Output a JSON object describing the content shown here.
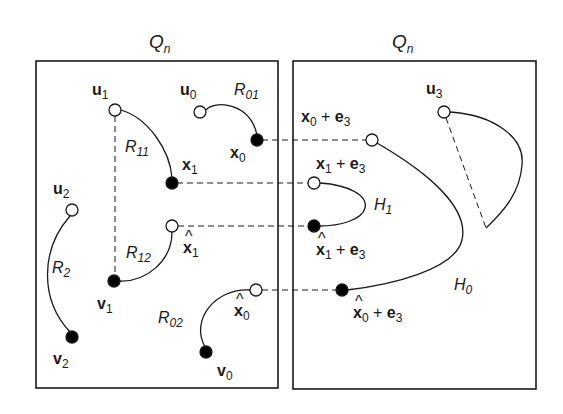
{
  "figure": {
    "left_panel": {
      "title": "Q",
      "title_sub": "n"
    },
    "right_panel": {
      "title": "Q",
      "title_sub": "n"
    },
    "colors": {
      "stroke": "#1a1a1a",
      "open_node_fill": "#ffffff",
      "closed_node_fill": "#000000"
    }
  },
  "labels": {
    "u1": {
      "base": "u",
      "sub": "1"
    },
    "u0": {
      "base": "u",
      "sub": "0"
    },
    "R01": {
      "base": "R",
      "sub": "01"
    },
    "R11": {
      "base": "R",
      "sub": "11"
    },
    "x1": {
      "base": "x",
      "sub": "1"
    },
    "x0": {
      "base": "x",
      "sub": "0"
    },
    "u2": {
      "base": "u",
      "sub": "2"
    },
    "R12": {
      "base": "R",
      "sub": "12"
    },
    "xhat1": {
      "hat": "^",
      "base": "x",
      "sub": "1"
    },
    "R2": {
      "base": "R",
      "sub": "2"
    },
    "v1": {
      "base": "v",
      "sub": "1"
    },
    "xhat0": {
      "hat": "^",
      "base": "x",
      "sub": "0"
    },
    "R02": {
      "base": "R",
      "sub": "02"
    },
    "v2": {
      "base": "v",
      "sub": "2"
    },
    "v0": {
      "base": "v",
      "sub": "0"
    },
    "u3": {
      "base": "u",
      "sub": "3"
    },
    "x0e3": {
      "base": "x",
      "sub": "0",
      "plus": " + ",
      "e": "e",
      "esub": "3"
    },
    "x1e3": {
      "base": "x",
      "sub": "1",
      "plus": " + ",
      "e": "e",
      "esub": "3"
    },
    "H1": {
      "base": "H",
      "sub": "1"
    },
    "xhat1e3": {
      "hat": "^",
      "base": "x",
      "sub": "1",
      "plus": " + ",
      "e": "e",
      "esub": "3"
    },
    "H0": {
      "base": "H",
      "sub": "0"
    },
    "xhat0e3": {
      "hat": "^",
      "base": "x",
      "sub": "0",
      "plus": " + ",
      "e": "e",
      "esub": "3"
    }
  }
}
